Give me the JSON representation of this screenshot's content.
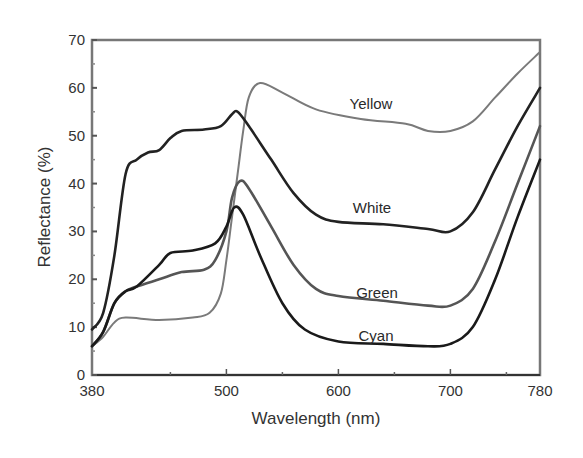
{
  "chart_data": {
    "type": "line",
    "title": "",
    "xlabel": "Wavelength (nm)",
    "ylabel": "Reflectance (%)",
    "xlim": [
      380,
      780
    ],
    "ylim": [
      0,
      70
    ],
    "xticks": [
      380,
      500,
      600,
      700,
      780
    ],
    "yticks": [
      0,
      10,
      20,
      30,
      40,
      50,
      60,
      70
    ],
    "grid": false,
    "legend": "inline labels",
    "series": [
      {
        "name": "Yellow",
        "color": "#7a7a7a",
        "x": [
          380,
          390,
          400,
          410,
          440,
          470,
          485,
          495,
          500,
          505,
          510,
          515,
          520,
          530,
          550,
          580,
          620,
          660,
          680,
          700,
          720,
          740,
          760,
          780
        ],
        "y": [
          6,
          8,
          11,
          12,
          11.5,
          12,
          13,
          17,
          24,
          33,
          42,
          51,
          58,
          61,
          59,
          55.5,
          53.5,
          52.5,
          51,
          51,
          53,
          58,
          63,
          67.5
        ],
        "label_pos": [
          370,
          104
        ]
      },
      {
        "name": "White",
        "color": "#222222",
        "x": [
          380,
          390,
          400,
          410,
          420,
          430,
          440,
          450,
          460,
          480,
          495,
          505,
          510,
          520,
          540,
          560,
          580,
          600,
          640,
          680,
          700,
          720,
          740,
          760,
          780
        ],
        "y": [
          9.5,
          13,
          25,
          42,
          45,
          46.5,
          47,
          49.5,
          51,
          51.3,
          52,
          54.5,
          55,
          52,
          45,
          38,
          33.5,
          32,
          31.5,
          30.5,
          30,
          34,
          43,
          52,
          60
        ],
        "label_pos": [
          372,
          213
        ]
      },
      {
        "name": "Green",
        "color": "#555555",
        "x": [
          380,
          390,
          400,
          410,
          420,
          440,
          460,
          480,
          490,
          500,
          505,
          512,
          520,
          540,
          560,
          580,
          600,
          640,
          680,
          700,
          720,
          740,
          760,
          780
        ],
        "y": [
          6,
          9,
          15,
          17.5,
          18.5,
          20,
          21.5,
          22,
          24,
          30,
          37,
          40.5,
          39,
          31,
          23,
          18,
          16.5,
          15.5,
          14.5,
          14.5,
          18,
          28,
          40,
          52
        ],
        "label_pos": [
          377,
          298
        ]
      },
      {
        "name": "Cyan",
        "color": "#1a1a1a",
        "x": [
          380,
          390,
          400,
          410,
          420,
          440,
          450,
          470,
          490,
          500,
          507,
          515,
          530,
          550,
          570,
          600,
          640,
          680,
          700,
          720,
          740,
          760,
          780
        ],
        "y": [
          6,
          9,
          15,
          17.5,
          18.5,
          23,
          25.5,
          26,
          27.5,
          31,
          35,
          33.5,
          25,
          15,
          9.5,
          7,
          6.5,
          6,
          6.5,
          10,
          20,
          33,
          45
        ],
        "label_pos": [
          376,
          341
        ]
      }
    ]
  },
  "axes": {
    "x_title": "Wavelength (nm)",
    "y_title": "Reflectance (%)",
    "x_tick_labels": [
      "380",
      "500",
      "600",
      "700",
      "780"
    ],
    "y_tick_labels": [
      "0",
      "10",
      "20",
      "30",
      "40",
      "50",
      "60",
      "70"
    ]
  },
  "labels": {
    "yellow": "Yellow",
    "white": "White",
    "green": "Green",
    "cyan": "Cyan"
  }
}
